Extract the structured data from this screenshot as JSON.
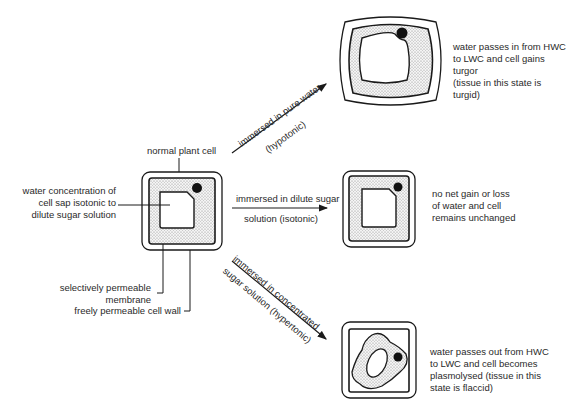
{
  "diagram": {
    "normal_cell": {
      "label": "normal plant cell",
      "sap_label_lines": [
        "water concentration of",
        "cell sap isotonic to",
        "dilute sugar solution"
      ],
      "membrane_label_lines": [
        "selectively permeable",
        "membrane"
      ],
      "wall_label": "freely permeable cell wall"
    },
    "arrows": [
      {
        "id": "hypotonic",
        "top": "immersed in pure water",
        "bottom": "(hypotonic)"
      },
      {
        "id": "isotonic",
        "top": "immersed in dilute sugar",
        "bottom": "solution (isotonic)"
      },
      {
        "id": "hypertonic",
        "top": "immersed in concentrated",
        "bottom": "sugar solution (hypertonic)"
      }
    ],
    "outcomes": [
      {
        "id": "turgid",
        "lines": [
          "water passes in from HWC",
          "to LWC and cell gains turgor",
          "(tissue in this state is turgid)"
        ]
      },
      {
        "id": "unchanged",
        "lines": [
          "no net gain or loss",
          "of water and cell",
          "remains unchanged"
        ]
      },
      {
        "id": "plasmolysed",
        "lines": [
          "water passes out from HWC",
          "to LWC and cell becomes",
          "plasmolysed (tissue in this",
          "state is flaccid)"
        ]
      }
    ],
    "colors": {
      "line": "#1a1a1a",
      "cytoplasm_stipple": "#b8b8b8",
      "background": "#ffffff"
    }
  }
}
